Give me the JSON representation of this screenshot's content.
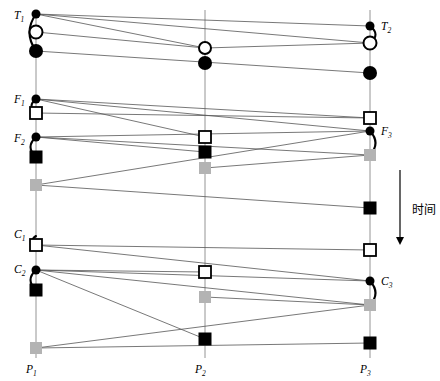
{
  "figure": {
    "type": "sequence-timeline-diagram",
    "background": "#ffffff",
    "width": 440,
    "height": 381,
    "axis_arrow": {
      "label": "时间",
      "direction": "down",
      "x": 400,
      "y_start": 170,
      "y_end": 245,
      "label_x": 412,
      "label_y": 204,
      "color": "#000000"
    },
    "colors": {
      "line": "#555555",
      "marker_dark": "#000000",
      "marker_gray": "#b3b3b3",
      "marker_open_fill": "#ffffff",
      "lifeline": "#888888"
    },
    "lifelines": [
      {
        "id": "P1",
        "x": 36,
        "y_top": 10,
        "y_bottom": 358,
        "label": "P",
        "sub": "1",
        "label_x": 26,
        "label_y": 364
      },
      {
        "id": "P2",
        "x": 205,
        "y_top": 10,
        "y_bottom": 358,
        "label": "P",
        "sub": "2",
        "label_x": 195,
        "label_y": 364
      },
      {
        "id": "P3",
        "x": 370,
        "y_top": 10,
        "y_bottom": 358,
        "label": "P",
        "sub": "3",
        "label_x": 360,
        "label_y": 364
      }
    ],
    "event_labels": [
      {
        "id": "T1",
        "label": "T",
        "sub": "1",
        "x": 14,
        "y": 10
      },
      {
        "id": "T2",
        "label": "T",
        "sub": "2",
        "x": 381,
        "y": 21
      },
      {
        "id": "F1",
        "label": "F",
        "sub": "1",
        "x": 14,
        "y": 94
      },
      {
        "id": "F2",
        "label": "F",
        "sub": "2",
        "x": 14,
        "y": 133
      },
      {
        "id": "F3",
        "label": "F",
        "sub": "3",
        "x": 381,
        "y": 126
      },
      {
        "id": "C1",
        "label": "C",
        "sub": "1",
        "x": 14,
        "y": 229
      },
      {
        "id": "C2",
        "label": "C",
        "sub": "2",
        "x": 14,
        "y": 264
      },
      {
        "id": "C3",
        "label": "C",
        "sub": "3",
        "x": 381,
        "y": 276
      }
    ],
    "markers": [
      {
        "id": "m-p1-dot-t1",
        "shape": "dot",
        "x": 36,
        "y": 14,
        "size": 9
      },
      {
        "id": "m-p1-open-t1",
        "shape": "open-circle",
        "x": 36,
        "y": 32,
        "size": 13
      },
      {
        "id": "m-p1-fill-t1",
        "shape": "filled-circle",
        "x": 36,
        "y": 51,
        "size": 14
      },
      {
        "id": "m-p2-open-t",
        "shape": "open-circle",
        "x": 205,
        "y": 48,
        "size": 12
      },
      {
        "id": "m-p2-fill-t",
        "shape": "filled-circle",
        "x": 205,
        "y": 63,
        "size": 14
      },
      {
        "id": "m-p3-dot-t2",
        "shape": "dot",
        "x": 370,
        "y": 26,
        "size": 9
      },
      {
        "id": "m-p3-open-t2",
        "shape": "open-circle",
        "x": 370,
        "y": 43,
        "size": 13
      },
      {
        "id": "m-p3-fill-t2",
        "shape": "filled-circle",
        "x": 370,
        "y": 73,
        "size": 14
      },
      {
        "id": "m-p1-dot-f1",
        "shape": "dot",
        "x": 36,
        "y": 99,
        "size": 9
      },
      {
        "id": "m-p1-open-f1",
        "shape": "open-square",
        "x": 36,
        "y": 113,
        "size": 12
      },
      {
        "id": "m-p1-dot-f2",
        "shape": "dot",
        "x": 36,
        "y": 137,
        "size": 9
      },
      {
        "id": "m-p1-black-f2",
        "shape": "filled-square",
        "x": 36,
        "y": 157,
        "size": 13
      },
      {
        "id": "m-p1-gray-f",
        "shape": "gray-square",
        "x": 36,
        "y": 185,
        "size": 12
      },
      {
        "id": "m-p2-open-f",
        "shape": "open-square",
        "x": 205,
        "y": 137,
        "size": 12
      },
      {
        "id": "m-p2-black-f",
        "shape": "filled-square",
        "x": 205,
        "y": 152,
        "size": 13
      },
      {
        "id": "m-p2-gray-f",
        "shape": "gray-square",
        "x": 205,
        "y": 168,
        "size": 12
      },
      {
        "id": "m-p3-open-f3",
        "shape": "open-square",
        "x": 370,
        "y": 118,
        "size": 12
      },
      {
        "id": "m-p3-dot-f3",
        "shape": "dot",
        "x": 370,
        "y": 131,
        "size": 9
      },
      {
        "id": "m-p3-gray-f3",
        "shape": "gray-square",
        "x": 370,
        "y": 155,
        "size": 12
      },
      {
        "id": "m-p3-black-f3",
        "shape": "filled-square",
        "x": 370,
        "y": 208,
        "size": 13
      },
      {
        "id": "m-p1-open-c1",
        "shape": "open-square",
        "x": 36,
        "y": 245,
        "size": 12
      },
      {
        "id": "m-p1-dot-c2",
        "shape": "dot",
        "x": 36,
        "y": 270,
        "size": 9
      },
      {
        "id": "m-p1-black-c2",
        "shape": "filled-square",
        "x": 36,
        "y": 290,
        "size": 13
      },
      {
        "id": "m-p1-gray-c",
        "shape": "gray-square",
        "x": 36,
        "y": 348,
        "size": 12
      },
      {
        "id": "m-p2-open-c",
        "shape": "open-square",
        "x": 205,
        "y": 272,
        "size": 12
      },
      {
        "id": "m-p2-gray-c",
        "shape": "gray-square",
        "x": 205,
        "y": 297,
        "size": 12
      },
      {
        "id": "m-p2-black-c",
        "shape": "filled-square",
        "x": 205,
        "y": 339,
        "size": 13
      },
      {
        "id": "m-p3-open-c3",
        "shape": "open-square",
        "x": 370,
        "y": 250,
        "size": 12
      },
      {
        "id": "m-p3-dot-c3",
        "shape": "dot",
        "x": 370,
        "y": 281,
        "size": 9
      },
      {
        "id": "m-p3-gray-c3",
        "shape": "gray-square",
        "x": 370,
        "y": 305,
        "size": 12
      },
      {
        "id": "m-p3-black-c3",
        "shape": "filled-square",
        "x": 370,
        "y": 343,
        "size": 13
      }
    ],
    "message_lines": [
      {
        "id": "l-t1-a",
        "x1": 36,
        "y1": 14,
        "x2": 370,
        "y2": 26
      },
      {
        "id": "l-t1-b",
        "x1": 36,
        "y1": 14,
        "x2": 370,
        "y2": 43
      },
      {
        "id": "l-t1-c",
        "x1": 36,
        "y1": 14,
        "x2": 205,
        "y2": 48
      },
      {
        "id": "l-t1-d",
        "x1": 36,
        "y1": 32,
        "x2": 205,
        "y2": 48
      },
      {
        "id": "l-t1-e",
        "x1": 205,
        "y1": 48,
        "x2": 370,
        "y2": 43
      },
      {
        "id": "l-t1-f",
        "x1": 36,
        "y1": 51,
        "x2": 370,
        "y2": 73
      },
      {
        "id": "l-f1-a",
        "x1": 36,
        "y1": 99,
        "x2": 370,
        "y2": 118
      },
      {
        "id": "l-f1-b",
        "x1": 36,
        "y1": 99,
        "x2": 370,
        "y2": 131
      },
      {
        "id": "l-f1-c",
        "x1": 36,
        "y1": 99,
        "x2": 205,
        "y2": 137
      },
      {
        "id": "l-f1-d",
        "x1": 36,
        "y1": 113,
        "x2": 370,
        "y2": 118
      },
      {
        "id": "l-f2-a",
        "x1": 36,
        "y1": 137,
        "x2": 370,
        "y2": 131
      },
      {
        "id": "l-f2-b",
        "x1": 36,
        "y1": 137,
        "x2": 205,
        "y2": 152
      },
      {
        "id": "l-f2-c",
        "x1": 36,
        "y1": 137,
        "x2": 370,
        "y2": 155
      },
      {
        "id": "l-f2-d",
        "x1": 205,
        "y1": 168,
        "x2": 370,
        "y2": 155
      },
      {
        "id": "l-f3-a",
        "x1": 36,
        "y1": 185,
        "x2": 370,
        "y2": 131
      },
      {
        "id": "l-f3-b",
        "x1": 36,
        "y1": 185,
        "x2": 370,
        "y2": 208
      },
      {
        "id": "l-c1-a",
        "x1": 36,
        "y1": 245,
        "x2": 370,
        "y2": 250
      },
      {
        "id": "l-c1-b",
        "x1": 36,
        "y1": 245,
        "x2": 370,
        "y2": 281
      },
      {
        "id": "l-c2-a",
        "x1": 36,
        "y1": 270,
        "x2": 205,
        "y2": 272
      },
      {
        "id": "l-c2-b",
        "x1": 36,
        "y1": 270,
        "x2": 370,
        "y2": 281
      },
      {
        "id": "l-c2-c",
        "x1": 36,
        "y1": 270,
        "x2": 370,
        "y2": 305
      },
      {
        "id": "l-c2-d",
        "x1": 36,
        "y1": 270,
        "x2": 205,
        "y2": 339
      },
      {
        "id": "l-c3-a",
        "x1": 36,
        "y1": 348,
        "x2": 370,
        "y2": 305
      },
      {
        "id": "l-c3-b",
        "x1": 36,
        "y1": 348,
        "x2": 370,
        "y2": 343
      },
      {
        "id": "l-c3-c",
        "x1": 205,
        "y1": 297,
        "x2": 370,
        "y2": 305
      }
    ],
    "arcs": [
      {
        "id": "arc-t1",
        "x1": 36,
        "y1": 14,
        "x2": 36,
        "y2": 51,
        "bulge": -13
      },
      {
        "id": "arc-t2",
        "x1": 370,
        "y1": 26,
        "x2": 370,
        "y2": 43,
        "bulge": 11
      },
      {
        "id": "arc-f1",
        "x1": 36,
        "y1": 99,
        "x2": 36,
        "y2": 113,
        "bulge": -9
      },
      {
        "id": "arc-f2",
        "x1": 36,
        "y1": 137,
        "x2": 36,
        "y2": 157,
        "bulge": -11
      },
      {
        "id": "arc-f3",
        "x1": 370,
        "y1": 131,
        "x2": 370,
        "y2": 155,
        "bulge": 11
      },
      {
        "id": "arc-c1",
        "x1": 36,
        "y1": 236,
        "x2": 36,
        "y2": 245,
        "bulge": -7
      },
      {
        "id": "arc-c2",
        "x1": 36,
        "y1": 270,
        "x2": 36,
        "y2": 290,
        "bulge": -11
      },
      {
        "id": "arc-c3",
        "x1": 370,
        "y1": 281,
        "x2": 370,
        "y2": 305,
        "bulge": 11
      }
    ]
  }
}
